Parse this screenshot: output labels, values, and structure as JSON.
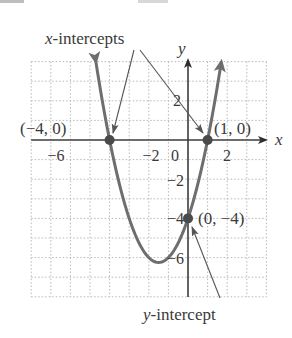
{
  "figure": {
    "annotations": {
      "x_intercepts_label": "x-intercepts",
      "x_intercepts_label_var": "x",
      "x_intercepts_label_rest": "-intercepts",
      "y_intercept_label_var": "y",
      "y_intercept_label_rest": "-intercept"
    },
    "axes": {
      "x_label": "x",
      "y_label": "y",
      "x_ticks": [
        {
          "value": -6,
          "label": "−6"
        },
        {
          "value": -2,
          "label": "−2"
        },
        {
          "value": 0,
          "label": "0"
        },
        {
          "value": 2,
          "label": "2"
        }
      ],
      "y_ticks": [
        {
          "value": 2,
          "label": "2"
        },
        {
          "value": -2,
          "label": "−2"
        },
        {
          "value": -4,
          "label": "−4"
        },
        {
          "value": -6,
          "label": "−6"
        }
      ]
    },
    "points": [
      {
        "label": "(−4, 0)",
        "x": -4,
        "y": 0
      },
      {
        "label": "(1, 0)",
        "x": 1,
        "y": 0
      },
      {
        "label": "(0, −4)",
        "x": 0,
        "y": -4
      }
    ],
    "colors": {
      "curve": "#6e6e6e",
      "axis": "#3c3c3c",
      "grid": "#b8b8b8",
      "point": "#4a4a4a",
      "text": "#3a3a3a"
    }
  },
  "chart_data": {
    "type": "line",
    "title": "",
    "function": "y = x^2 + 3x - 4",
    "xlabel": "x",
    "ylabel": "y",
    "xlim": [
      -8,
      4
    ],
    "ylim": [
      -8,
      4
    ],
    "grid": true,
    "x_tick_labels": [
      "−6",
      "−2",
      "0",
      "2"
    ],
    "y_tick_labels": [
      "2",
      "−2",
      "−4",
      "−6"
    ],
    "series": [
      {
        "name": "parabola",
        "x": [
          -4.7,
          -4,
          -3.5,
          -3,
          -2.5,
          -2,
          -1.5,
          -1,
          -0.5,
          0,
          0.5,
          1,
          1.7
        ],
        "y": [
          4,
          0,
          -2.25,
          -4,
          -5.25,
          -6,
          -6.25,
          -6,
          -5.25,
          -4,
          -2.25,
          0,
          4
        ]
      }
    ],
    "highlighted_points": [
      {
        "label": "(−4, 0)",
        "x": -4,
        "y": 0
      },
      {
        "label": "(1, 0)",
        "x": 1,
        "y": 0
      },
      {
        "label": "(0, −4)",
        "x": 0,
        "y": -4
      }
    ],
    "annotations": [
      "x-intercepts",
      "y-intercept"
    ],
    "vertex": {
      "x": -1.5,
      "y": -6.25
    }
  }
}
